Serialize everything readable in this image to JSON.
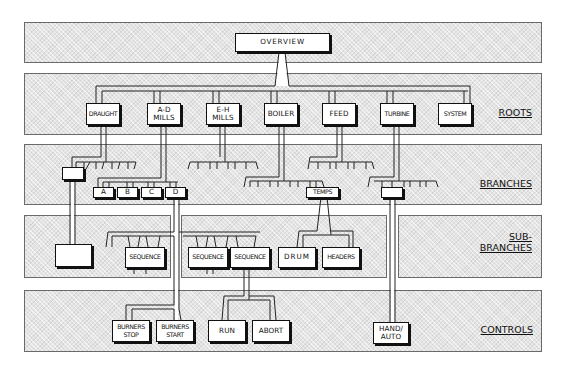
{
  "levels": {
    "roots": "ROOTS",
    "branches": "BRANCHES",
    "sub_branches": "SUB-\nBRANCHES",
    "controls": "CONTROLS"
  },
  "overview": {
    "label": "OVERVIEW"
  },
  "roots": [
    {
      "label": "DRAUGHT"
    },
    {
      "label": "A-D\nMILLS"
    },
    {
      "label": "E-H\nMILLS"
    },
    {
      "label": "BOILER"
    },
    {
      "label": "FEED"
    },
    {
      "label": "TURBINE"
    },
    {
      "label": "SYSTEM"
    }
  ],
  "branches": {
    "draught_box": {
      "label": ""
    },
    "mills": [
      {
        "label": "A"
      },
      {
        "label": "B"
      },
      {
        "label": "C"
      },
      {
        "label": "D"
      }
    ],
    "temps": {
      "label": "TEMPS"
    },
    "turbine_box": {
      "label": ""
    }
  },
  "sub_branches": {
    "draught_box": {
      "label": ""
    },
    "sequences": [
      {
        "label": "SEQUENCE"
      },
      {
        "label": "SEQUENCE"
      },
      {
        "label": "SEQUENCE"
      }
    ],
    "drum": {
      "label": "DRUM"
    },
    "headers": {
      "label": "HEADERS"
    }
  },
  "controls": [
    {
      "label": "BURNERS\nSTOP"
    },
    {
      "label": "BURNERS\nSTART"
    },
    {
      "label": "RUN"
    },
    {
      "label": "ABORT"
    },
    {
      "label": "HAND/\nAUTO"
    }
  ]
}
